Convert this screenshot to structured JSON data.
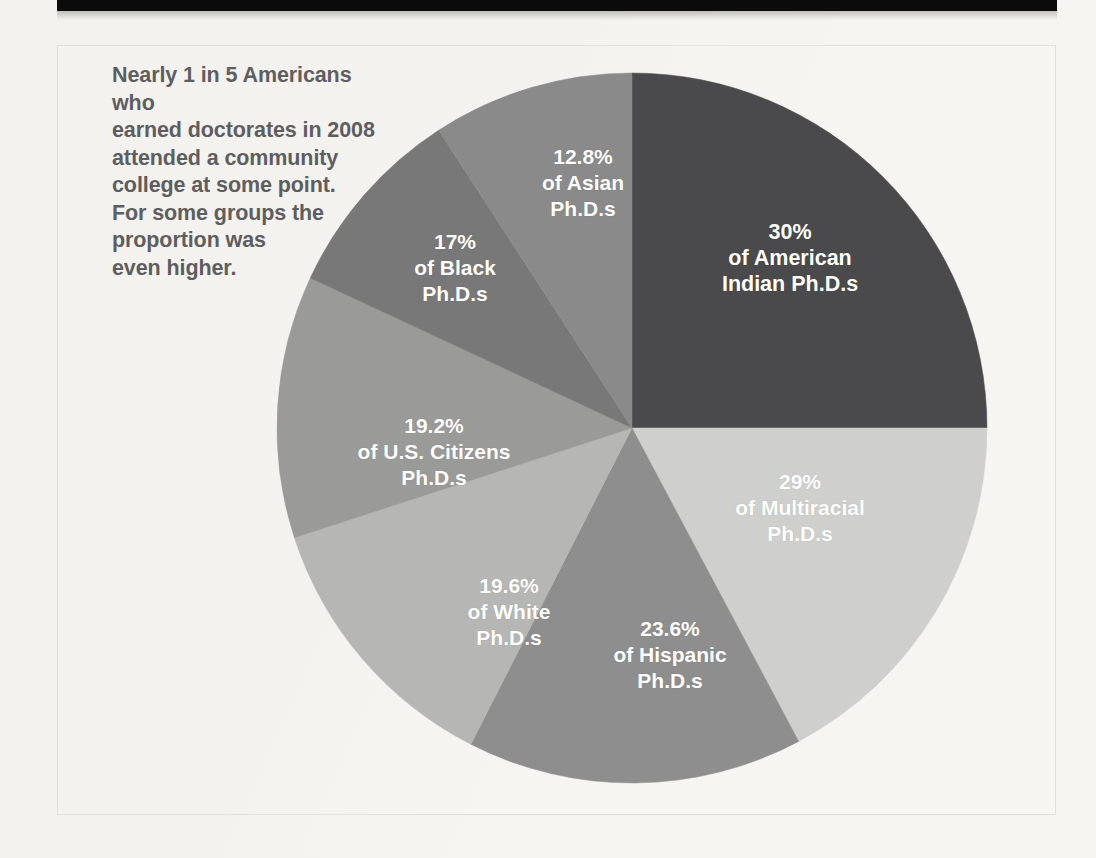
{
  "figure": {
    "caption": "Nearly 1 in 5 Americans who\nearned doctorates in 2008\nattended a community\ncollege at some point.\nFor some groups the\nproportion was\neven higher.",
    "caption_color": "#5e5e60",
    "background_color": "#f6f5f1",
    "frame_color": "#e3e1dc",
    "top_bar_color": "#0b0b0c",
    "label_text_color": "#ffffff"
  },
  "chart_data": {
    "type": "pie",
    "title": "Nearly 1 in 5 Americans who earned doctorates in 2008 attended a community college at some point. For some groups the proportion was even higher.",
    "xlabel": "",
    "ylabel": "",
    "unit": "percent",
    "legend_position": "none",
    "grid": false,
    "note": "Each slice is labeled with the share of that group's Ph.D. recipients who attended a community college; slice angles are drawn roughly proportional to these shares.",
    "categories": [
      "American Indian Ph.D.s",
      "Multiracial Ph.D.s",
      "Hispanic Ph.D.s",
      "White Ph.D.s",
      "U.S. Citizens Ph.D.s",
      "Black Ph.D.s",
      "Asian Ph.D.s"
    ],
    "values": [
      30,
      29,
      23.6,
      19.6,
      19.2,
      17,
      12.8
    ],
    "value_labels": [
      "30%",
      "29%",
      "23.6%",
      "19.6%",
      "19.2%",
      "17%",
      "12.8%"
    ],
    "colors": [
      "#4a4a4c",
      "#cfcfcd",
      "#8e8e8e",
      "#b6b6b4",
      "#9a9a99",
      "#787878",
      "#8a8a8a"
    ],
    "slices": [
      {
        "name": "american-indian",
        "percent_label": "30%",
        "group_label": "of American\nIndian Ph.D.s",
        "full_label": "30%\nof American\nIndian Ph.D.s",
        "value": 30,
        "color": "#4a4a4c",
        "start_angle": 0,
        "end_angle": 90
      },
      {
        "name": "multiracial",
        "percent_label": "29%",
        "group_label": "of Multiracial\nPh.D.s",
        "full_label": "29%\nof Multiracial\nPh.D.s",
        "value": 29,
        "color": "#cfcfcd",
        "start_angle": 90,
        "end_angle": 152
      },
      {
        "name": "hispanic",
        "percent_label": "23.6%",
        "group_label": "of Hispanic\nPh.D.s",
        "full_label": "23.6%\nof Hispanic\nPh.D.s",
        "value": 23.6,
        "color": "#8e8e8e",
        "start_angle": 152,
        "end_angle": 207
      },
      {
        "name": "white",
        "percent_label": "19.6%",
        "group_label": "of White\nPh.D.s",
        "full_label": "19.6%\nof White\nPh.D.s",
        "value": 19.6,
        "color": "#b6b6b4",
        "start_angle": 207,
        "end_angle": 252
      },
      {
        "name": "us-citizens",
        "percent_label": "19.2%",
        "group_label": "of U.S. Citizens\nPh.D.s",
        "full_label": "19.2%\nof U.S. Citizens\nPh.D.s",
        "value": 19.2,
        "color": "#9a9a99",
        "start_angle": 252,
        "end_angle": 295
      },
      {
        "name": "black",
        "percent_label": "17%",
        "group_label": "of Black\nPh.D.s",
        "full_label": "17%\nof Black\nPh.D.s",
        "value": 17,
        "color": "#787878",
        "start_angle": 295,
        "end_angle": 327
      },
      {
        "name": "asian",
        "percent_label": "12.8%",
        "group_label": "of Asian\nPh.D.s",
        "full_label": "12.8%\nof Asian\nPh.D.s",
        "value": 12.8,
        "color": "#8a8a8a",
        "start_angle": 327,
        "end_angle": 360
      }
    ],
    "geometry": {
      "center_x": 632,
      "center_y": 428,
      "radius": 355
    }
  }
}
